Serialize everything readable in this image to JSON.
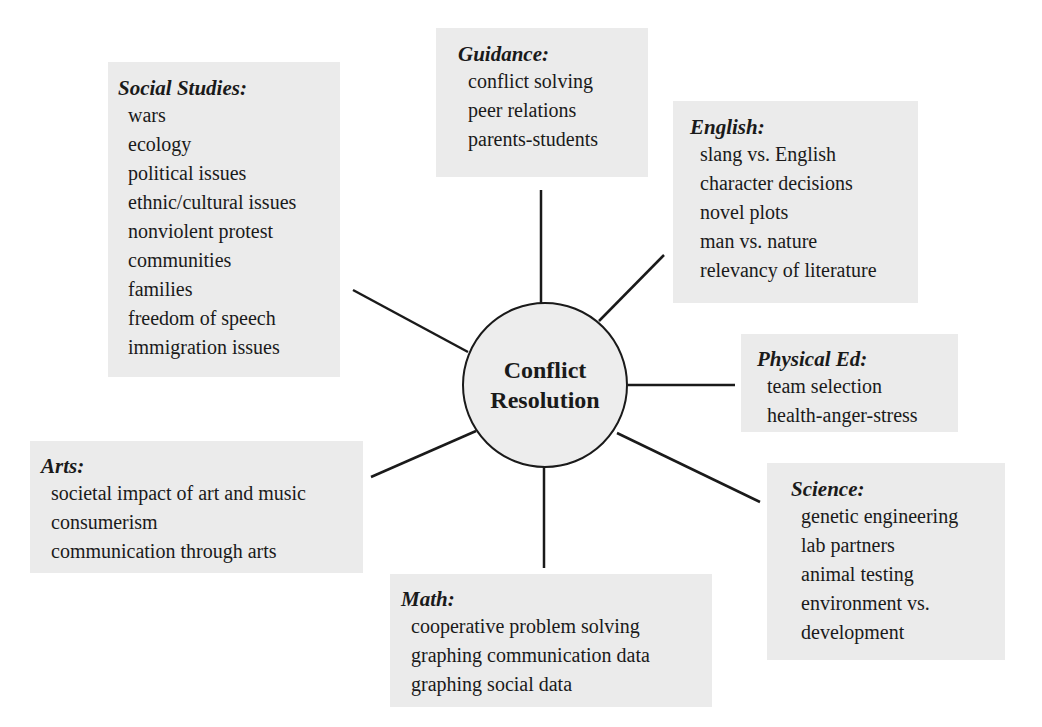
{
  "center": {
    "line1": "Conflict",
    "line2": "Resolution"
  },
  "colors": {
    "box_background": "#ebebeb",
    "hub_background": "#ededed",
    "line": "#1a1a1a",
    "page_background": "#ffffff"
  },
  "subjects": {
    "social_studies": {
      "title": "Social Studies:",
      "items": [
        "wars",
        "ecology",
        "political issues",
        "ethnic/cultural issues",
        "nonviolent protest",
        "communities",
        "families",
        "freedom of speech",
        "immigration issues"
      ]
    },
    "guidance": {
      "title": "Guidance:",
      "items": [
        "conflict solving",
        "peer relations",
        "parents-students"
      ]
    },
    "english": {
      "title": "English:",
      "items": [
        "slang vs. English",
        "character decisions",
        "novel plots",
        "man vs. nature",
        "relevancy of literature"
      ]
    },
    "physical_ed": {
      "title": "Physical Ed:",
      "items": [
        "team selection",
        "health-anger-stress"
      ]
    },
    "science": {
      "title": "Science:",
      "items": [
        "genetic engineering",
        "lab partners",
        "animal testing",
        "environment vs.",
        "development"
      ]
    },
    "math": {
      "title": "Math:",
      "items": [
        "cooperative problem solving",
        "graphing communication data",
        "graphing social data"
      ]
    },
    "arts": {
      "title": "Arts:",
      "items": [
        "societal impact of art and music",
        "consumerism",
        "communication through arts"
      ]
    }
  }
}
